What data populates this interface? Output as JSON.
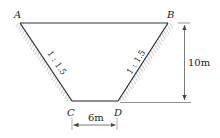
{
  "diagram": {
    "type": "trapezoid-channel-cross-section",
    "points": {
      "A": "A",
      "B": "B",
      "C": "C",
      "D": "D"
    },
    "slopes": {
      "left": "1 : 1.5",
      "right": "1 : 1.5"
    },
    "dimensions": {
      "height": "10m",
      "bottom_width": "6m"
    },
    "colors": {
      "line": "#333333",
      "hatch": "#888888",
      "dimension": "#555555"
    }
  }
}
